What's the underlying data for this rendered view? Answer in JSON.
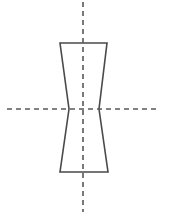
{
  "canvas": {
    "width": 170,
    "height": 220,
    "background": "#ffffff",
    "title": "hourglass-profile-outline"
  },
  "style": {
    "outline_color": "#4a4a4a",
    "outline_width": 1.6,
    "centerline_color": "#58585a",
    "centerline_width": 1.6,
    "centerline_dash": "5 4"
  },
  "figure": {
    "name": "hourglass-outline",
    "points": {
      "top_left": {
        "x": 60,
        "y": 43
      },
      "top_right": {
        "x": 107,
        "y": 43
      },
      "waist_right": {
        "x": 99,
        "y": 109
      },
      "bottom_right": {
        "x": 108,
        "y": 172
      },
      "bottom_left": {
        "x": 60,
        "y": 172
      },
      "waist_left": {
        "x": 69,
        "y": 109
      }
    },
    "path": "M 60 43 L 107 43 L 99 109 L 108 172 L 60 172 L 69 109 Z"
  },
  "centerlines": {
    "vertical": {
      "name": "vertical-centerline",
      "x": 83,
      "y1": 2,
      "y2": 212
    },
    "horizontal": {
      "name": "horizontal-centerline",
      "y": 109,
      "x1": 7,
      "x2": 158
    }
  }
}
